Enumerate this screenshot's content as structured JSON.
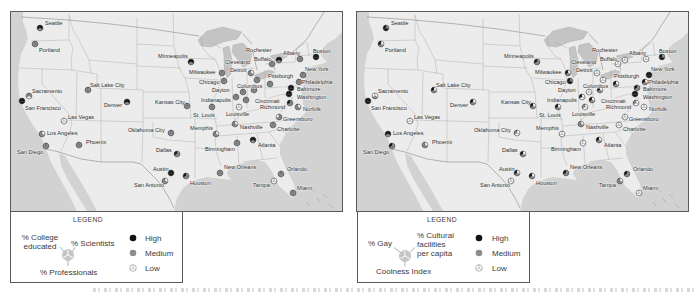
{
  "colors": {
    "high": "#111111",
    "medium": "#8c8c8c",
    "low": "#ffffff",
    "land": "#ececec",
    "water": "#d2d2d2",
    "lakes": "#c4c4c4",
    "border": "#5a5a5a",
    "state_lines": "#a9a9a9",
    "legend_pie": "#c4c4c4"
  },
  "left_legend": {
    "title": "LEGEND",
    "ul_line1": "% College",
    "ul_line2": "educated",
    "ur_label": "% Scientists",
    "bottom_label": "% Professionals",
    "levels": {
      "high": "High",
      "medium": "Medium",
      "low": "Low"
    }
  },
  "right_legend": {
    "title": "LEGEND",
    "ul_label": "% Gay",
    "ur_line1": "% Cultural",
    "ur_line2": "facilities",
    "ur_line3": "per capita",
    "bottom_label": "Coolness Index",
    "levels": {
      "high": "High",
      "medium": "Medium",
      "low": "Low"
    }
  },
  "segment_order": [
    "upper-left",
    "upper-right",
    "bottom"
  ],
  "level_codes": {
    "H": "High",
    "M": "Medium",
    "L": "Low"
  },
  "cities": [
    {
      "name": "Seattle",
      "dot": [
        29,
        16
      ],
      "label": [
        34,
        11
      ],
      "education": [
        "H",
        "H",
        "M"
      ],
      "coolness": [
        "H",
        "M",
        "H"
      ]
    },
    {
      "name": "Portland",
      "dot": [
        24,
        32
      ],
      "label": [
        28,
        38
      ],
      "education": [
        "M",
        "M",
        "M"
      ],
      "coolness": [
        "H",
        "L",
        "M"
      ]
    },
    {
      "name": "Sacramento",
      "dot": [
        18,
        84
      ],
      "label": [
        21,
        79
      ],
      "education": [
        "M",
        "M",
        "L"
      ],
      "coolness": [
        "L",
        "L",
        "M"
      ]
    },
    {
      "name": "San Francisco",
      "dot": [
        11,
        89
      ],
      "label": [
        14,
        96
      ],
      "education": [
        "H",
        "H",
        "H"
      ],
      "coolness": [
        "H",
        "H",
        "H"
      ]
    },
    {
      "name": "Salt Lake City",
      "dot": [
        77,
        78
      ],
      "label": [
        79,
        73
      ],
      "education": [
        "M",
        "M",
        "M"
      ],
      "coolness": [
        "H",
        "L",
        "M"
      ]
    },
    {
      "name": "Denver",
      "dot": [
        116,
        90
      ],
      "label": [
        93,
        93
      ],
      "education": [
        "H",
        "H",
        "M"
      ],
      "coolness": [
        "H",
        "L",
        "M"
      ]
    },
    {
      "name": "Las Vegas",
      "dot": [
        53,
        109
      ],
      "label": [
        57,
        105
      ],
      "education": [
        "L",
        "L",
        "L"
      ],
      "coolness": [
        "L",
        "L",
        "L"
      ]
    },
    {
      "name": "Los Angeles",
      "dot": [
        31,
        122
      ],
      "label": [
        36,
        121
      ],
      "education": [
        "M",
        "L",
        "M"
      ],
      "coolness": [
        "H",
        "H",
        "M"
      ]
    },
    {
      "name": "San Diego",
      "dot": [
        35,
        134
      ],
      "label": [
        6,
        140
      ],
      "education": [
        "M",
        "M",
        "M"
      ],
      "coolness": [
        "H",
        "M",
        "M"
      ]
    },
    {
      "name": "Phoenix",
      "dot": [
        68,
        133
      ],
      "label": [
        75,
        130
      ],
      "education": [
        "M",
        "M",
        "M"
      ],
      "coolness": [
        "M",
        "L",
        "M"
      ]
    },
    {
      "name": "Oklahoma City",
      "dot": [
        160,
        121
      ],
      "label": [
        117,
        118
      ],
      "education": [
        "M",
        "M",
        "M"
      ],
      "coolness": [
        "M",
        "L",
        "L"
      ]
    },
    {
      "name": "Kansas City",
      "dot": [
        176,
        94
      ],
      "label": [
        144,
        90
      ],
      "education": [
        "M",
        "M",
        "M"
      ],
      "coolness": [
        "H",
        "L",
        "M"
      ]
    },
    {
      "name": "Dallas",
      "dot": [
        166,
        142
      ],
      "label": [
        145,
        138
      ],
      "education": [
        "H",
        "M",
        "M"
      ],
      "coolness": [
        "H",
        "L",
        "M"
      ]
    },
    {
      "name": "Austin",
      "dot": [
        160,
        161
      ],
      "label": [
        142,
        157
      ],
      "education": [
        "H",
        "H",
        "H"
      ],
      "coolness": [
        "H",
        "L",
        "M"
      ]
    },
    {
      "name": "San Antonio",
      "dot": [
        154,
        169
      ],
      "label": [
        123,
        173
      ],
      "education": [
        "M",
        "L",
        "M"
      ],
      "coolness": [
        "L",
        "L",
        "L"
      ]
    },
    {
      "name": "Houston",
      "dot": [
        175,
        164
      ],
      "label": [
        179,
        171
      ],
      "education": [
        "H",
        "M",
        "M"
      ],
      "coolness": [
        "H",
        "L",
        "M"
      ]
    },
    {
      "name": "Minneapolis",
      "dot": [
        180,
        50
      ],
      "label": [
        147,
        44
      ],
      "education": [
        "H",
        "H",
        "M"
      ],
      "coolness": [
        "H",
        "M",
        "M"
      ]
    },
    {
      "name": "Milwaukee",
      "dot": [
        211,
        61
      ],
      "label": [
        178,
        60
      ],
      "education": [
        "M",
        "M",
        "M"
      ],
      "coolness": [
        "H",
        "L",
        "M"
      ]
    },
    {
      "name": "Chicago",
      "dot": [
        213,
        69
      ],
      "label": [
        188,
        70
      ],
      "education": [
        "M",
        "M",
        "M"
      ],
      "coolness": [
        "H",
        "M",
        "H"
      ]
    },
    {
      "name": "Detroit",
      "dot": [
        240,
        61
      ],
      "label": [
        219,
        58
      ],
      "education": [
        "M",
        "L",
        "M"
      ],
      "coolness": [
        "L",
        "L",
        "L"
      ]
    },
    {
      "name": "Cleveland",
      "dot": [
        246,
        68
      ],
      "label": [
        214,
        50
      ],
      "education": [
        "M",
        "M",
        "M"
      ],
      "coolness": [
        "L",
        "L",
        "L"
      ]
    },
    {
      "name": "Columbus",
      "dot": [
        243,
        78
      ],
      "label": [
        226,
        74
      ],
      "education": [
        "M",
        "M",
        "M"
      ],
      "coolness": [
        "H",
        "L",
        "M"
      ]
    },
    {
      "name": "Dayton",
      "dot": [
        232,
        80
      ],
      "label": [
        201,
        78
      ],
      "education": [
        "M",
        "M",
        "M"
      ],
      "coolness": [
        "L",
        "L",
        "L"
      ]
    },
    {
      "name": "Indianapolis",
      "dot": [
        225,
        85
      ],
      "label": [
        190,
        88
      ],
      "education": [
        "M",
        "M",
        "M"
      ],
      "coolness": [
        "H",
        "L",
        "L"
      ]
    },
    {
      "name": "Cincinnati",
      "dot": [
        235,
        88
      ],
      "label": [
        244,
        89
      ],
      "education": [
        "M",
        "M",
        "M"
      ],
      "coolness": [
        "H",
        "L",
        "M"
      ]
    },
    {
      "name": "Pittsburgh",
      "dot": [
        259,
        72
      ],
      "label": [
        257,
        64
      ],
      "education": [
        "M",
        "M",
        "M"
      ],
      "coolness": [
        "H",
        "L",
        "M"
      ]
    },
    {
      "name": "Buffalo",
      "dot": [
        261,
        52
      ],
      "label": [
        243,
        47
      ],
      "education": [
        "M",
        "M",
        "M"
      ],
      "coolness": [
        "L",
        "L",
        "L"
      ]
    },
    {
      "name": "Rochester",
      "dot": [
        268,
        48
      ],
      "label": [
        235,
        38
      ],
      "education": [
        "H",
        "H",
        "M"
      ],
      "coolness": [
        "L",
        "L",
        "L"
      ]
    },
    {
      "name": "Albany",
      "dot": [
        289,
        47
      ],
      "label": [
        272,
        41
      ],
      "education": [
        "M",
        "M",
        "M"
      ],
      "coolness": [
        "L",
        "L",
        "L"
      ]
    },
    {
      "name": "Boston",
      "dot": [
        305,
        45
      ],
      "label": [
        302,
        39
      ],
      "education": [
        "H",
        "H",
        "H"
      ],
      "coolness": [
        "H",
        "M",
        "H"
      ]
    },
    {
      "name": "New York",
      "dot": [
        292,
        63
      ],
      "label": [
        294,
        57
      ],
      "education": [
        "M",
        "M",
        "M"
      ],
      "coolness": [
        "H",
        "H",
        "H"
      ]
    },
    {
      "name": "Philadelphia",
      "dot": [
        288,
        70
      ],
      "label": [
        291,
        70
      ],
      "education": [
        "M",
        "M",
        "M"
      ],
      "coolness": [
        "H",
        "L",
        "M"
      ]
    },
    {
      "name": "Baltimore",
      "dot": [
        280,
        76
      ],
      "label": [
        286,
        77
      ],
      "education": [
        "H",
        "H",
        "H"
      ],
      "coolness": [
        "H",
        "M",
        "M"
      ]
    },
    {
      "name": "Washington",
      "dot": [
        278,
        82
      ],
      "label": [
        286,
        85
      ],
      "education": [
        "H",
        "H",
        "H"
      ],
      "coolness": [
        "H",
        "H",
        "H"
      ]
    },
    {
      "name": "Richmond",
      "dot": [
        279,
        91
      ],
      "label": [
        249,
        95
      ],
      "education": [
        "H",
        "M",
        "M"
      ],
      "coolness": [
        "M",
        "L",
        "L"
      ]
    },
    {
      "name": "Norfolk",
      "dot": [
        287,
        95
      ],
      "label": [
        292,
        97
      ],
      "education": [
        "M",
        "L",
        "M"
      ],
      "coolness": [
        "L",
        "L",
        "L"
      ]
    },
    {
      "name": "Greensboro",
      "dot": [
        268,
        105
      ],
      "label": [
        272,
        107
      ],
      "education": [
        "L",
        "M",
        "M"
      ],
      "coolness": [
        "L",
        "L",
        "L"
      ]
    },
    {
      "name": "Charlotte",
      "dot": [
        262,
        113
      ],
      "label": [
        266,
        117
      ],
      "education": [
        "M",
        "M",
        "M"
      ],
      "coolness": [
        "L",
        "L",
        "L"
      ]
    },
    {
      "name": "Nashville",
      "dot": [
        224,
        112
      ],
      "label": [
        229,
        115
      ],
      "education": [
        "M",
        "L",
        "M"
      ],
      "coolness": [
        "M",
        "L",
        "M"
      ]
    },
    {
      "name": "Louisville",
      "dot": [
        228,
        95
      ],
      "label": [
        215,
        102
      ],
      "education": [
        "L",
        "L",
        "L"
      ],
      "coolness": [
        "M",
        "L",
        "L"
      ]
    },
    {
      "name": "St. Louis",
      "dot": [
        201,
        95
      ],
      "label": [
        182,
        103
      ],
      "education": [
        "M",
        "M",
        "M"
      ],
      "coolness": [
        "H",
        "L",
        "M"
      ]
    },
    {
      "name": "Memphis",
      "dot": [
        205,
        122
      ],
      "label": [
        179,
        116
      ],
      "education": [
        "M",
        "L",
        "M"
      ],
      "coolness": [
        "L",
        "L",
        "L"
      ]
    },
    {
      "name": "Birmingham",
      "dot": [
        226,
        131
      ],
      "label": [
        194,
        137
      ],
      "education": [
        "M",
        "M",
        "M"
      ],
      "coolness": [
        "L",
        "L",
        "L"
      ]
    },
    {
      "name": "Atlanta",
      "dot": [
        242,
        128
      ],
      "label": [
        247,
        133
      ],
      "education": [
        "H",
        "H",
        "M"
      ],
      "coolness": [
        "H",
        "L",
        "M"
      ]
    },
    {
      "name": "New Orleans",
      "dot": [
        209,
        161
      ],
      "label": [
        213,
        155
      ],
      "education": [
        "M",
        "M",
        "M"
      ],
      "coolness": [
        "H",
        "M",
        "M"
      ]
    },
    {
      "name": "Tampa",
      "dot": [
        263,
        169
      ],
      "label": [
        242,
        173
      ],
      "education": [
        "L",
        "L",
        "L"
      ],
      "coolness": [
        "M",
        "L",
        "M"
      ]
    },
    {
      "name": "Orlando",
      "dot": [
        270,
        162
      ],
      "label": [
        276,
        157
      ],
      "education": [
        "M",
        "M",
        "M"
      ],
      "coolness": [
        "H",
        "M",
        "M"
      ]
    },
    {
      "name": "Miami",
      "dot": [
        282,
        181
      ],
      "label": [
        286,
        176
      ],
      "education": [
        "M",
        "M",
        "M"
      ],
      "coolness": [
        "L",
        "L",
        "L"
      ]
    }
  ]
}
